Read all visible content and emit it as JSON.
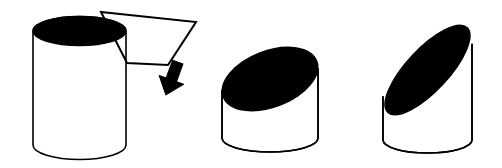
{
  "document": {
    "title": "Cylinder oblique cross-section sequence",
    "background_color": "#FFFFFF",
    "stroke_color": "#000000",
    "fill_color": "#000000",
    "width": 502,
    "height": 168
  },
  "figures": [
    {
      "id": "figure-1",
      "name": "upright-cylinder-with-cutting-plane",
      "label": "Upright cylinder with horizontal cutting plane",
      "cylinder": {
        "name": "tall-cylinder",
        "left": 33,
        "right": 126,
        "top_center_y": 31,
        "bottom_center_y": 145,
        "rx": 46.5,
        "ry": 14.5,
        "top_face_fill": "#000000",
        "body_fill": "#FFFFFF",
        "tilt_deg": 0
      },
      "callout": {
        "name": "cutting-plane-quadrilateral",
        "points": "101,12 196,22 168,65 127,63",
        "fill": "none",
        "stroke": "#000000",
        "stroke_width": 2
      },
      "arrow": {
        "name": "down-arrow",
        "direction": "down-left",
        "rotation_deg": 20,
        "fill": "#000000",
        "center_x": 172,
        "center_y": 78
      }
    },
    {
      "id": "figure-2",
      "name": "cylinder-shallow-oblique-cut",
      "label": "Cylinder cut at shallow oblique angle",
      "cylinder": {
        "name": "short-cylinder",
        "left": 222,
        "right": 318,
        "top_center_y": 79,
        "bottom_center_y": 138,
        "rx": 48,
        "ry": 14,
        "top_face_fill": "#000000",
        "body_fill": "#FFFFFF",
        "cut_tilt_deg": -21,
        "cut_rx": 50,
        "cut_ry": 28
      }
    },
    {
      "id": "figure-3",
      "name": "cylinder-steep-oblique-cut",
      "label": "Cylinder cut at steep oblique angle",
      "cylinder": {
        "name": "angled-cylinder",
        "left": 383,
        "right": 472,
        "top_center_y": 70,
        "bottom_center_y": 140,
        "rx": 44.5,
        "ry": 13,
        "top_face_fill": "#000000",
        "body_fill": "#FFFFFF",
        "cut_tilt_deg": -47,
        "cut_rx": 58,
        "cut_ry": 21
      }
    }
  ]
}
